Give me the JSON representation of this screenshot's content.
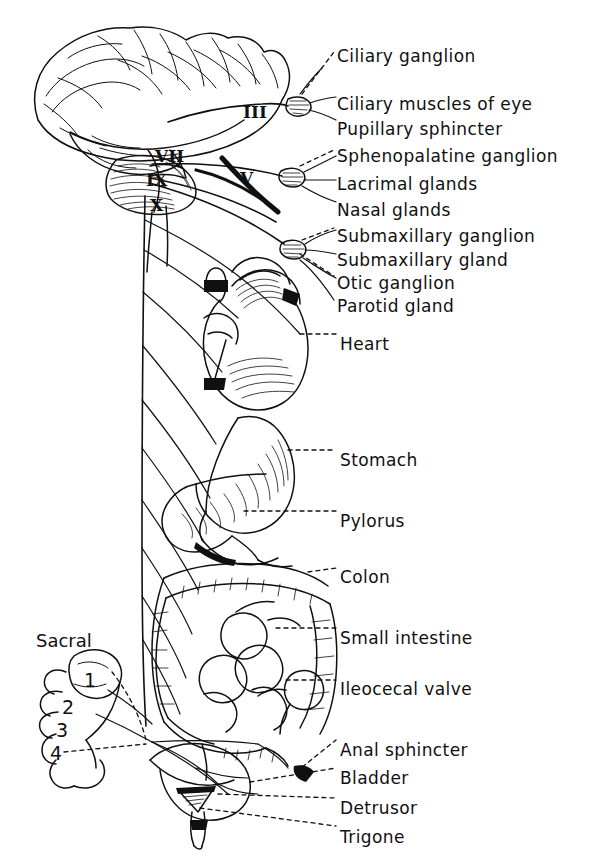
{
  "figure": {
    "type": "anatomical-line-diagram",
    "background_color": "#ffffff",
    "ink_color": "#101010"
  },
  "regions": {
    "cranial_label": "Sacral"
  },
  "cranial_nerves": [
    {
      "numeral": "III",
      "x": 243,
      "y": 104
    },
    {
      "numeral": "VII",
      "x": 155,
      "y": 148
    },
    {
      "numeral": "IX",
      "x": 146,
      "y": 172
    },
    {
      "numeral": "V",
      "x": 240,
      "y": 170
    },
    {
      "numeral": "X",
      "x": 150,
      "y": 197
    }
  ],
  "sacral_segments": [
    {
      "numeral": "1",
      "x": 84,
      "y": 671
    },
    {
      "numeral": "2",
      "x": 62,
      "y": 698
    },
    {
      "numeral": "3",
      "x": 56,
      "y": 721
    },
    {
      "numeral": "4",
      "x": 50,
      "y": 744
    }
  ],
  "labels": [
    {
      "text": "Ciliary ganglion",
      "x": 337,
      "y": 48,
      "leader": "dashed"
    },
    {
      "text": "Ciliary muscles of eye",
      "x": 337,
      "y": 96,
      "leader": "solid"
    },
    {
      "text": "Pupillary  sphincter",
      "x": 337,
      "y": 121,
      "leader": "solid"
    },
    {
      "text": "Sphenopalatine ganglion",
      "x": 337,
      "y": 148,
      "leader": "dashed"
    },
    {
      "text": "Lacrimal glands",
      "x": 337,
      "y": 176,
      "leader": "solid"
    },
    {
      "text": "Nasal glands",
      "x": 337,
      "y": 202,
      "leader": "solid"
    },
    {
      "text": "Submaxillary  ganglion",
      "x": 337,
      "y": 228,
      "leader": "dashed"
    },
    {
      "text": "Submaxillary  gland",
      "x": 337,
      "y": 252,
      "leader": "solid"
    },
    {
      "text": "Otic ganglion",
      "x": 337,
      "y": 275,
      "leader": "dashed"
    },
    {
      "text": "Parotid gland",
      "x": 337,
      "y": 298,
      "leader": "solid"
    },
    {
      "text": "Heart",
      "x": 340,
      "y": 336,
      "leader": "dashed"
    },
    {
      "text": "Stomach",
      "x": 340,
      "y": 452,
      "leader": "dashed"
    },
    {
      "text": "Pylorus",
      "x": 340,
      "y": 513,
      "leader": "dashed"
    },
    {
      "text": "Colon",
      "x": 340,
      "y": 569,
      "leader": "dashed"
    },
    {
      "text": "Small intestine",
      "x": 340,
      "y": 630,
      "leader": "dashed"
    },
    {
      "text": "Ileocecal valve",
      "x": 340,
      "y": 681,
      "leader": "dashed"
    },
    {
      "text": "Anal sphincter",
      "x": 340,
      "y": 742,
      "leader": "dashed"
    },
    {
      "text": "Bladder",
      "x": 340,
      "y": 770,
      "leader": "dashed"
    },
    {
      "text": "Detrusor",
      "x": 340,
      "y": 800,
      "leader": "dashed"
    },
    {
      "text": "Trigone",
      "x": 340,
      "y": 829,
      "leader": "dashed"
    }
  ]
}
